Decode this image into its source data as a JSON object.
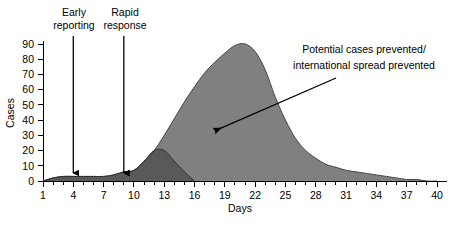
{
  "chart_data": {
    "type": "area",
    "title": "",
    "xlabel": "Days",
    "ylabel": "Cases",
    "xlim": [
      1,
      40
    ],
    "ylim": [
      0,
      90
    ],
    "grid": false,
    "legend": "none",
    "x_tick_labels": [
      "1",
      "4",
      "7",
      "10",
      "13",
      "16",
      "19",
      "22",
      "25",
      "28",
      "31",
      "34",
      "37",
      "40"
    ],
    "x_tick_values": [
      1,
      4,
      7,
      10,
      13,
      16,
      19,
      22,
      25,
      28,
      31,
      34,
      37,
      40
    ],
    "x_minor_tick_step": 1,
    "y_tick_labels": [
      "0",
      "10",
      "20",
      "30",
      "40",
      "50",
      "60",
      "70",
      "80",
      "90"
    ],
    "y_tick_values": [
      0,
      10,
      20,
      30,
      40,
      50,
      60,
      70,
      80,
      90
    ],
    "series": [
      {
        "name": "Uncontrolled outbreak (potential cases)",
        "color": "#808080",
        "x": [
          1,
          2,
          3,
          4,
          5,
          6,
          7,
          8,
          9,
          10,
          11,
          12,
          13,
          14,
          15,
          16,
          17,
          18,
          19,
          20,
          21,
          22,
          23,
          24,
          25,
          26,
          27,
          28,
          29,
          30,
          31,
          32,
          33,
          34,
          35,
          36,
          37,
          38,
          39,
          40
        ],
        "values": [
          0,
          2,
          3,
          3,
          3,
          3,
          3,
          4,
          6,
          7,
          13,
          20,
          30,
          41,
          52,
          62,
          71,
          78,
          84,
          89,
          90,
          85,
          73,
          55,
          40,
          28,
          20,
          15,
          11,
          9,
          7,
          6,
          5,
          4,
          3,
          2,
          1,
          1,
          0,
          0
        ]
      },
      {
        "name": "Contained outbreak (actual cases after rapid response)",
        "color": "#595959",
        "x": [
          1,
          2,
          3,
          4,
          5,
          6,
          7,
          8,
          9,
          10,
          11,
          12,
          13,
          14,
          15,
          16
        ],
        "values": [
          0,
          2,
          3,
          3,
          3,
          3,
          3,
          4,
          6,
          7,
          13,
          20,
          20,
          13,
          6,
          0
        ]
      }
    ],
    "annotations": [
      {
        "name": "early-reporting",
        "label": "Early\nreporting",
        "label_line_1": "Early",
        "label_line_2": "reporting",
        "day": 4,
        "type": "down-arrow"
      },
      {
        "name": "rapid-response",
        "label": "Rapid\nresponse",
        "label_line_1": "Rapid",
        "label_line_2": "response",
        "day": 9,
        "type": "down-arrow"
      },
      {
        "name": "prevented-callout",
        "label_line_1": "Potential cases prevented/",
        "label_line_2": "international spread prevented",
        "type": "leader-arrow",
        "points_to_day": 18,
        "points_to_cases": 33
      }
    ],
    "colors": {
      "area_light": "#808080",
      "area_dark": "#595959",
      "axis": "#000000",
      "text": "#000000",
      "background": "#ffffff"
    }
  }
}
